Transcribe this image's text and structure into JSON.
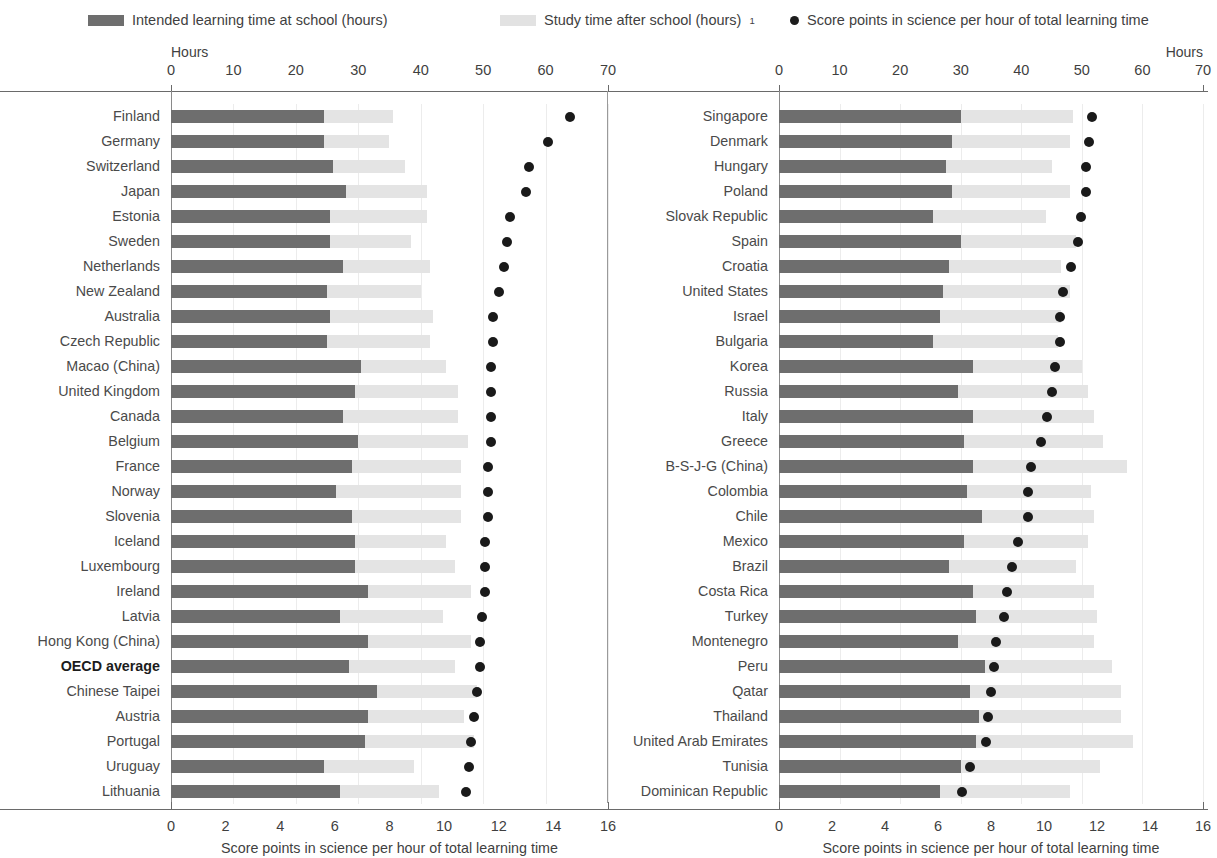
{
  "legend": {
    "items": [
      {
        "label": "Intended learning time at school (hours)",
        "marker": "dark-swatch",
        "color": "#6e6e6e"
      },
      {
        "label": "Study time after school (hours)",
        "superscript": "1",
        "marker": "light-swatch",
        "color": "#e2e2e2"
      },
      {
        "label": "Score points in science per hour of total learning time",
        "marker": "dot",
        "color": "#1d1d1d"
      }
    ]
  },
  "axes": {
    "hours_label": "Hours",
    "hours_ticks": [
      0,
      10,
      20,
      30,
      40,
      50,
      60,
      70
    ],
    "hours_range": [
      0,
      70
    ],
    "score_ticks": [
      0,
      2,
      4,
      6,
      8,
      10,
      12,
      14,
      16
    ],
    "score_range": [
      0,
      16
    ],
    "score_axis_title": "Score points in science per hour of total learning time"
  },
  "chart_data": {
    "type": "bar",
    "title": "",
    "subtitle": "",
    "xlabel": "Score points in science per hour of total learning time",
    "ylabel": "",
    "xlabel_top": "Hours",
    "xlim_hours": [
      0,
      70
    ],
    "xlim_score": [
      0,
      16
    ],
    "grid": true,
    "legend_position": "top",
    "series": [
      {
        "name": "Intended learning time at school (hours)",
        "type": "bar",
        "color": "#6e6e6e",
        "axis": "hours"
      },
      {
        "name": "Study time after school (hours)",
        "type": "bar",
        "color": "#e4e4e4",
        "axis": "hours",
        "stacked": true
      },
      {
        "name": "Score points in science per hour of total learning time",
        "type": "scatter",
        "color": "#1a1a1a",
        "axis": "score"
      }
    ],
    "panels": [
      {
        "id": "left-panel",
        "rows": [
          {
            "category": "Finland",
            "intended": 24.5,
            "after_school": 11.0,
            "score": 14.6
          },
          {
            "category": "Germany",
            "intended": 24.5,
            "after_school": 10.5,
            "score": 13.8
          },
          {
            "category": "Switzerland",
            "intended": 26.0,
            "after_school": 11.5,
            "score": 13.1
          },
          {
            "category": "Japan",
            "intended": 28.0,
            "after_school": 13.0,
            "score": 13.0
          },
          {
            "category": "Estonia",
            "intended": 25.5,
            "after_school": 15.5,
            "score": 12.4
          },
          {
            "category": "Sweden",
            "intended": 25.5,
            "after_school": 13.0,
            "score": 12.3
          },
          {
            "category": "Netherlands",
            "intended": 27.5,
            "after_school": 14.0,
            "score": 12.2
          },
          {
            "category": "New Zealand",
            "intended": 25.0,
            "after_school": 15.0,
            "score": 12.0
          },
          {
            "category": "Australia",
            "intended": 25.5,
            "after_school": 16.5,
            "score": 11.8
          },
          {
            "category": "Czech Republic",
            "intended": 25.0,
            "after_school": 16.5,
            "score": 11.8
          },
          {
            "category": "Macao (China)",
            "intended": 30.5,
            "after_school": 13.5,
            "score": 11.7
          },
          {
            "category": "United Kingdom",
            "intended": 29.5,
            "after_school": 16.5,
            "score": 11.7
          },
          {
            "category": "Canada",
            "intended": 27.5,
            "after_school": 18.5,
            "score": 11.7
          },
          {
            "category": "Belgium",
            "intended": 30.0,
            "after_school": 17.5,
            "score": 11.7
          },
          {
            "category": "France",
            "intended": 29.0,
            "after_school": 17.5,
            "score": 11.6
          },
          {
            "category": "Norway",
            "intended": 26.5,
            "after_school": 20.0,
            "score": 11.6
          },
          {
            "category": "Slovenia",
            "intended": 29.0,
            "after_school": 17.5,
            "score": 11.6
          },
          {
            "category": "Iceland",
            "intended": 29.5,
            "after_school": 14.5,
            "score": 11.5
          },
          {
            "category": "Luxembourg",
            "intended": 29.5,
            "after_school": 16.0,
            "score": 11.5
          },
          {
            "category": "Ireland",
            "intended": 31.5,
            "after_school": 16.5,
            "score": 11.5
          },
          {
            "category": "Latvia",
            "intended": 27.0,
            "after_school": 16.5,
            "score": 11.4
          },
          {
            "category": "Hong Kong (China)",
            "intended": 31.5,
            "after_school": 16.5,
            "score": 11.3
          },
          {
            "category": "OECD average",
            "intended": 28.5,
            "after_school": 17.0,
            "score": 11.3,
            "highlight": true
          },
          {
            "category": "Chinese Taipei",
            "intended": 33.0,
            "after_school": 16.0,
            "score": 11.2
          },
          {
            "category": "Austria",
            "intended": 31.5,
            "after_school": 15.5,
            "score": 11.1
          },
          {
            "category": "Portugal",
            "intended": 31.0,
            "after_school": 17.5,
            "score": 11.0
          },
          {
            "category": "Uruguay",
            "intended": 24.5,
            "after_school": 14.5,
            "score": 10.9
          },
          {
            "category": "Lithuania",
            "intended": 27.0,
            "after_school": 16.0,
            "score": 10.8
          }
        ]
      },
      {
        "id": "right-panel",
        "rows": [
          {
            "category": "Singapore",
            "intended": 30.0,
            "after_school": 18.5,
            "score": 11.8
          },
          {
            "category": "Denmark",
            "intended": 28.5,
            "after_school": 19.5,
            "score": 11.7
          },
          {
            "category": "Hungary",
            "intended": 27.5,
            "after_school": 17.5,
            "score": 11.6
          },
          {
            "category": "Poland",
            "intended": 28.5,
            "after_school": 19.5,
            "score": 11.6
          },
          {
            "category": "Slovak Republic",
            "intended": 25.5,
            "after_school": 18.5,
            "score": 11.4
          },
          {
            "category": "Spain",
            "intended": 30.0,
            "after_school": 19.0,
            "score": 11.3
          },
          {
            "category": "Croatia",
            "intended": 28.0,
            "after_school": 18.5,
            "score": 11.0
          },
          {
            "category": "United States",
            "intended": 27.0,
            "after_school": 21.0,
            "score": 10.7
          },
          {
            "category": "Israel",
            "intended": 26.5,
            "after_school": 20.0,
            "score": 10.6
          },
          {
            "category": "Bulgaria",
            "intended": 25.5,
            "after_school": 20.5,
            "score": 10.6
          },
          {
            "category": "Korea",
            "intended": 32.0,
            "after_school": 18.0,
            "score": 10.4
          },
          {
            "category": "Russia",
            "intended": 29.5,
            "after_school": 21.5,
            "score": 10.3
          },
          {
            "category": "Italy",
            "intended": 32.0,
            "after_school": 20.0,
            "score": 10.1
          },
          {
            "category": "Greece",
            "intended": 30.5,
            "after_school": 23.0,
            "score": 9.9
          },
          {
            "category": "B-S-J-G (China)",
            "intended": 32.0,
            "after_school": 25.5,
            "score": 9.5
          },
          {
            "category": "Colombia",
            "intended": 31.0,
            "after_school": 20.5,
            "score": 9.4
          },
          {
            "category": "Chile",
            "intended": 33.5,
            "after_school": 18.5,
            "score": 9.4
          },
          {
            "category": "Mexico",
            "intended": 30.5,
            "after_school": 20.5,
            "score": 9.0
          },
          {
            "category": "Brazil",
            "intended": 28.0,
            "after_school": 21.0,
            "score": 8.8
          },
          {
            "category": "Costa Rica",
            "intended": 32.0,
            "after_school": 20.0,
            "score": 8.6
          },
          {
            "category": "Turkey",
            "intended": 32.5,
            "after_school": 20.0,
            "score": 8.5
          },
          {
            "category": "Montenegro",
            "intended": 29.5,
            "after_school": 22.5,
            "score": 8.2
          },
          {
            "category": "Peru",
            "intended": 34.0,
            "after_school": 21.0,
            "score": 8.1
          },
          {
            "category": "Qatar",
            "intended": 31.5,
            "after_school": 25.0,
            "score": 8.0
          },
          {
            "category": "Thailand",
            "intended": 33.0,
            "after_school": 23.5,
            "score": 7.9
          },
          {
            "category": "United Arab Emirates",
            "intended": 32.5,
            "after_school": 26.0,
            "score": 7.8
          },
          {
            "category": "Tunisia",
            "intended": 30.0,
            "after_school": 23.0,
            "score": 7.2
          },
          {
            "category": "Dominican Republic",
            "intended": 26.5,
            "after_school": 21.5,
            "score": 6.9
          }
        ]
      }
    ]
  }
}
